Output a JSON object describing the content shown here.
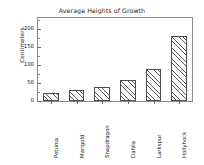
{
  "chart_data": {
    "type": "bar",
    "title": "Average Heights of Growth",
    "xlabel": "",
    "ylabel": "Centimeters",
    "categories": [
      "Petunia",
      "Marigold",
      "Snapdragon",
      "Dahlia",
      "Larkspur",
      "Hollyhock"
    ],
    "values": [
      23,
      31,
      39,
      57,
      90,
      180
    ],
    "ylim": [
      0,
      230
    ],
    "yticks": [
      0,
      50,
      100,
      150,
      200
    ],
    "ytick_labels": [
      "0",
      "50",
      "100",
      "150",
      "200"
    ],
    "yminor_ticks": [
      25,
      75,
      125,
      175,
      225
    ],
    "grid": false,
    "legend": null,
    "bar_fill": "hatched-diagonal",
    "bar_edge_color": "#4d4d4d",
    "frame_color": "#8c8c8c",
    "background": "#ffffff"
  }
}
